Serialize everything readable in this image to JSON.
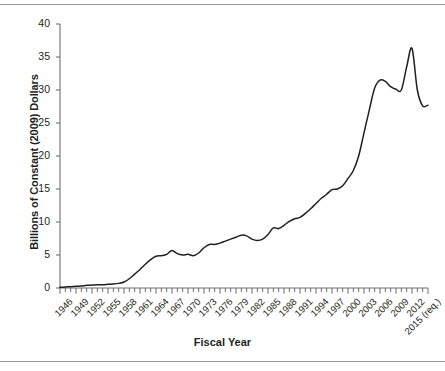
{
  "figure": {
    "background": "#ffffff",
    "rule_color": "#9a9a9a",
    "line_color": "#231f20"
  },
  "chart_data": {
    "type": "line",
    "title": "",
    "xlabel": "Fiscal Year",
    "ylabel": "Billions of Constant (2009) Dollars",
    "ylim": [
      0,
      40
    ],
    "ytick_values": [
      0,
      5,
      10,
      15,
      20,
      25,
      30,
      35,
      40
    ],
    "ytick_labels": [
      "0",
      "5",
      "10",
      "15",
      "20",
      "25",
      "30",
      "35",
      "40"
    ],
    "grid": false,
    "legend": "none",
    "xlim": [
      1946,
      2015
    ],
    "xtick_labels": [
      "1946",
      "1949",
      "1952",
      "1955",
      "1958",
      "1961",
      "1964",
      "1967",
      "1970",
      "1973",
      "1976",
      "1979",
      "1982",
      "1985",
      "1988",
      "1991",
      "1994",
      "1997",
      "2000",
      "2003",
      "2006",
      "2009",
      "2012",
      "2015 (req.)"
    ],
    "xtick_years": [
      1946,
      1949,
      1952,
      1955,
      1958,
      1961,
      1964,
      1967,
      1970,
      1973,
      1976,
      1979,
      1982,
      1985,
      1988,
      1991,
      1994,
      1997,
      2000,
      2003,
      2006,
      2009,
      2012,
      2015
    ],
    "minor_tick_interval_years": 1,
    "x": [
      1946,
      1947,
      1948,
      1949,
      1950,
      1951,
      1952,
      1953,
      1954,
      1955,
      1956,
      1957,
      1958,
      1959,
      1960,
      1961,
      1962,
      1963,
      1964,
      1965,
      1966,
      1967,
      1968,
      1969,
      1970,
      1971,
      1972,
      1973,
      1974,
      1975,
      1976,
      1977,
      1978,
      1979,
      1980,
      1981,
      1982,
      1983,
      1984,
      1985,
      1986,
      1987,
      1988,
      1989,
      1990,
      1991,
      1992,
      1993,
      1994,
      1995,
      1996,
      1997,
      1998,
      1999,
      2000,
      2001,
      2002,
      2003,
      2004,
      2005,
      2006,
      2007,
      2008,
      2009,
      2010,
      2011,
      2012,
      2013,
      2014,
      2015
    ],
    "values": [
      0.1,
      0.15,
      0.2,
      0.25,
      0.3,
      0.4,
      0.45,
      0.5,
      0.5,
      0.55,
      0.6,
      0.7,
      0.9,
      1.4,
      2.1,
      2.8,
      3.6,
      4.3,
      4.8,
      4.9,
      5.1,
      5.7,
      5.2,
      5.0,
      5.1,
      4.9,
      5.3,
      6.1,
      6.6,
      6.6,
      6.8,
      7.1,
      7.4,
      7.7,
      8.0,
      7.9,
      7.4,
      7.2,
      7.4,
      8.1,
      9.1,
      9.0,
      9.5,
      10.1,
      10.5,
      10.7,
      11.3,
      12.0,
      12.8,
      13.6,
      14.2,
      14.9,
      15.0,
      15.5,
      16.6,
      17.8,
      20.0,
      23.5,
      27.0,
      30.3,
      31.5,
      31.3,
      30.5,
      30.1,
      30.0,
      33.5,
      36.3,
      30.0,
      27.6,
      27.7
    ],
    "series_name": "Budget Authority"
  }
}
